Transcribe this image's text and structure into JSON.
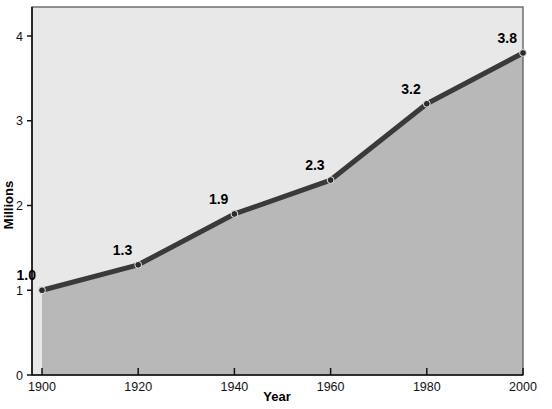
{
  "chart_data": {
    "type": "line",
    "title": "",
    "subtitle": "",
    "xlabel": "Year",
    "ylabel": "Millions",
    "x": [
      1900,
      1920,
      1940,
      1960,
      1980,
      2000
    ],
    "values": [
      1.0,
      1.3,
      1.9,
      2.3,
      3.2,
      3.8
    ],
    "point_labels": [
      "1.0",
      "1.3",
      "1.9",
      "2.3",
      "3.2",
      "3.8"
    ],
    "xtick_labels": [
      "1900",
      "1920",
      "1940",
      "1960",
      "1980",
      "2000"
    ],
    "ytick_labels": [
      "0",
      "1",
      "2",
      "3",
      "4"
    ],
    "ytick_values": [
      0,
      1,
      2,
      3,
      4
    ],
    "xlim": [
      1900,
      2000
    ],
    "ylim": [
      0,
      4.35
    ],
    "grid": false,
    "legend": "none",
    "fill_under_curve": true,
    "colors": {
      "line": "#3a3a3a",
      "marker": "#2b2b2b",
      "plot_background": "#e8e8e8",
      "area_fill": "#b8b8b8",
      "plot_border": "#555555",
      "axis": "#1a1a1a",
      "page_background": "#ffffff",
      "text": "#000000"
    }
  }
}
